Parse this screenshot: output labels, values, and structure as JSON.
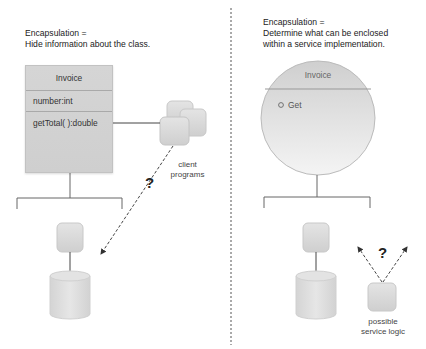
{
  "left_panel": {
    "caption_line1": "Encapsulation =",
    "caption_line2": "Hide information about the class.",
    "class_box": {
      "name": "Invoice",
      "attribute": "number:int",
      "method": "getTotal( ):double"
    },
    "client_label_line1": "client",
    "client_label_line2": "programs",
    "question_mark": "?"
  },
  "right_panel": {
    "caption_line1": "Encapsulation =",
    "caption_line2": "Determine what can be enclosed",
    "caption_line3": "within a service implementation.",
    "service_circle": {
      "name": "Invoice",
      "operation": "Get"
    },
    "question_mark": "?",
    "logic_label_line1": "possible",
    "logic_label_line2": "service logic"
  },
  "colors": {
    "box_fill": "#d3d3d3",
    "divider": "#999999",
    "line": "#555555",
    "text": "#222222"
  }
}
